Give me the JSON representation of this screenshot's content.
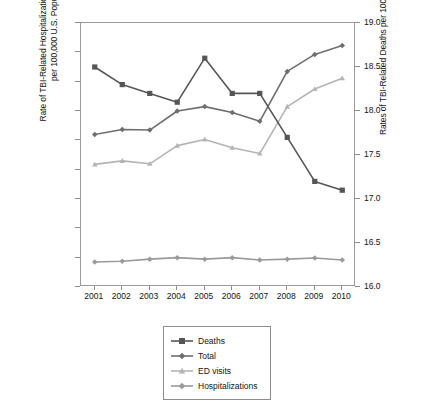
{
  "chart_data": {
    "type": "line",
    "title": "",
    "xlabel": "",
    "categories": [
      "2001",
      "2002",
      "2003",
      "2004",
      "2005",
      "2006",
      "2007",
      "2008",
      "2009",
      "2010"
    ],
    "grid": false,
    "legend_position": "bottom-center",
    "axes": {
      "left": {
        "label": "Rate of TBI-Related Hospitalizations and ED Visits\nper 100,000 U.S. Population",
        "ylim": [
          0,
          900
        ],
        "ticks": [
          0,
          100,
          200,
          300,
          400,
          500,
          600,
          700,
          800,
          900
        ],
        "tick_labels": [
          "0",
          "100",
          "200",
          "300",
          "400",
          "500",
          "600",
          "700",
          "800",
          "900"
        ]
      },
      "right": {
        "label": "Rates of TBI-Related Deaths per 100,000 U.S. Population",
        "ylim": [
          16.0,
          19.0
        ],
        "ticks": [
          16.0,
          16.5,
          17.0,
          17.5,
          18.0,
          18.5,
          19.0
        ],
        "tick_labels": [
          "16.0",
          "16.5",
          "17.0",
          "17.5",
          "18.0",
          "18.5",
          "19.0"
        ]
      }
    },
    "series": [
      {
        "name": "Deaths",
        "axis": "right",
        "color": "#565656",
        "marker": "square",
        "values": [
          18.5,
          18.3,
          18.2,
          18.1,
          18.6,
          18.2,
          18.2,
          17.7,
          17.2,
          17.1
        ]
      },
      {
        "name": "Total",
        "axis": "left",
        "color": "#6e6e6e",
        "marker": "diamond",
        "values": [
          520,
          537,
          535,
          600,
          615,
          595,
          565,
          735,
          793,
          823
        ]
      },
      {
        "name": "ED visits",
        "axis": "left",
        "color": "#b4b4b4",
        "marker": "triangle",
        "values": [
          418,
          430,
          420,
          482,
          503,
          475,
          455,
          615,
          675,
          712
        ]
      },
      {
        "name": "Hospitalizations",
        "axis": "left",
        "color": "#9a9a9a",
        "marker": "diamond",
        "values": [
          85,
          88,
          95,
          100,
          95,
          100,
          92,
          95,
          99,
          92
        ]
      }
    ]
  },
  "legend": {
    "items": [
      {
        "label": "Deaths"
      },
      {
        "label": "Total"
      },
      {
        "label": "ED visits"
      },
      {
        "label": "Hospitalizations"
      }
    ]
  },
  "colors": {
    "deaths": "#565656",
    "total": "#6e6e6e",
    "ed_visits": "#b4b4b4",
    "hospitalizations": "#9a9a9a",
    "axis": "#9a9a9a",
    "text": "#141414"
  }
}
